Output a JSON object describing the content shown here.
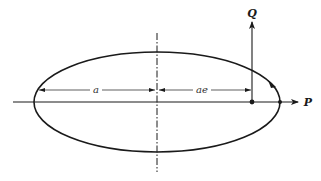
{
  "diagram": {
    "type": "ellipse-orbit",
    "labels": {
      "p_axis": "P",
      "q_axis": "Q",
      "semi_major": "a",
      "focal_offset": "ae"
    },
    "colors": {
      "stroke": "#1a1a1a",
      "background": "#ffffff"
    }
  }
}
